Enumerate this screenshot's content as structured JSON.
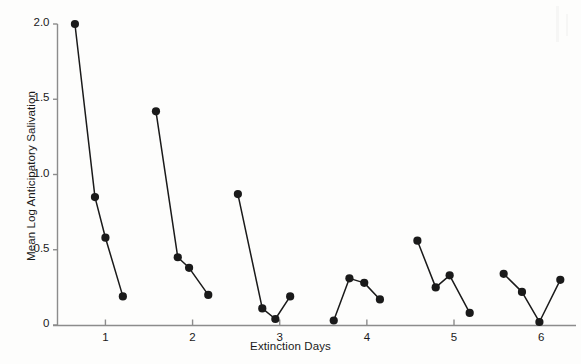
{
  "chart_data": {
    "type": "line",
    "title": "",
    "xlabel": "Extinction Days",
    "ylabel": "Mean Log Anticipatory Salivation",
    "xlim": [
      0.45,
      6.4
    ],
    "ylim": [
      0,
      2.0
    ],
    "xticks": [
      1,
      2,
      3,
      4,
      5,
      6
    ],
    "xtick_labels": [
      "1",
      "2",
      "3",
      "4",
      "5",
      "6"
    ],
    "yticks": [
      0,
      0.5,
      1.0,
      1.5,
      2.0
    ],
    "ytick_labels": [
      "0",
      "0.5",
      "1.0",
      "1.5",
      "2.0"
    ],
    "grid": false,
    "legend": null,
    "marker": "filled-circle",
    "line_color": "#1a1a1a",
    "marker_color": "#1a1a1a",
    "series": [
      {
        "name": "Day 1",
        "x": [
          0.65,
          0.88,
          1.0,
          1.2
        ],
        "y": [
          2.0,
          0.85,
          0.58,
          0.19
        ]
      },
      {
        "name": "Day 2",
        "x": [
          1.58,
          1.83,
          1.96,
          2.18
        ],
        "y": [
          1.42,
          0.45,
          0.38,
          0.2
        ]
      },
      {
        "name": "Day 3",
        "x": [
          2.52,
          2.8,
          2.95,
          3.12
        ],
        "y": [
          0.87,
          0.11,
          0.04,
          0.19
        ]
      },
      {
        "name": "Day 4",
        "x": [
          3.62,
          3.8,
          3.97,
          4.15
        ],
        "y": [
          0.03,
          0.31,
          0.28,
          0.17
        ]
      },
      {
        "name": "Day 5",
        "x": [
          4.58,
          4.79,
          4.95,
          5.18
        ],
        "y": [
          0.56,
          0.25,
          0.33,
          0.08
        ]
      },
      {
        "name": "Day 6",
        "x": [
          5.57,
          5.78,
          5.98,
          6.22
        ],
        "y": [
          0.34,
          0.22,
          0.02,
          0.3
        ]
      }
    ]
  }
}
